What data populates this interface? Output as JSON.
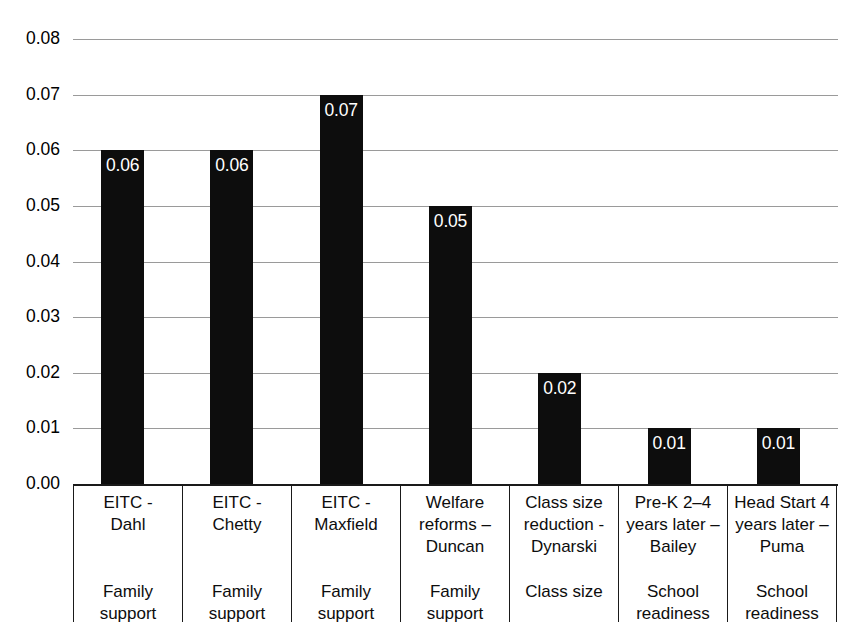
{
  "chart_data": {
    "type": "bar",
    "title": "",
    "subtitle": "",
    "xlabel": "",
    "ylabel": "",
    "ylim": [
      0.0,
      0.08
    ],
    "ytick_labels": [
      "0.08",
      "0.07",
      "0.06",
      "0.05",
      "0.04",
      "0.03",
      "0.02",
      "0.01",
      "0.00"
    ],
    "ytick_values": [
      0.08,
      0.07,
      0.06,
      0.05,
      0.04,
      0.03,
      0.02,
      0.01,
      0.0
    ],
    "grid": true,
    "grid_axis": "y",
    "legend": "none",
    "bar_color": "#0d0d0d",
    "data_label_color": "#ffffff",
    "gridline_color": "#9a9a9a",
    "categories": [
      "EITC - Dahl",
      "EITC - Chetty",
      "EITC - Maxfield",
      "Welfare reforms – Duncan",
      "Class size reduction - Dynarski",
      "Pre-K 2–4 years later – Bailey",
      "Head Start 4 years later – Puma"
    ],
    "values": [
      0.06,
      0.06,
      0.07,
      0.05,
      0.02,
      0.01,
      0.01
    ],
    "data_labels": [
      "0.06",
      "0.06",
      "0.07",
      "0.05",
      "0.02",
      "0.01",
      "0.01"
    ],
    "groups": [
      "Family support",
      "Family support",
      "Family support",
      "Family support",
      "Class size",
      "School readiness",
      "School readiness"
    ]
  },
  "axis": {
    "y_ticks": [
      {
        "label": "0.08",
        "value": 0.08
      },
      {
        "label": "0.07",
        "value": 0.07
      },
      {
        "label": "0.06",
        "value": 0.06
      },
      {
        "label": "0.05",
        "value": 0.05
      },
      {
        "label": "0.04",
        "value": 0.04
      },
      {
        "label": "0.03",
        "value": 0.03
      },
      {
        "label": "0.02",
        "value": 0.02
      },
      {
        "label": "0.01",
        "value": 0.01
      },
      {
        "label": "0.00",
        "value": 0.0
      }
    ]
  },
  "categories_table": {
    "rows": [
      {
        "name_lines": [
          "EITC -",
          "Dahl"
        ],
        "group_lines": [
          "Family",
          "support"
        ]
      },
      {
        "name_lines": [
          "EITC -",
          "Chetty"
        ],
        "group_lines": [
          "Family",
          "support"
        ]
      },
      {
        "name_lines": [
          "EITC -",
          "Maxfield"
        ],
        "group_lines": [
          "Family",
          "support"
        ]
      },
      {
        "name_lines": [
          "Welfare",
          "reforms –",
          "Duncan"
        ],
        "group_lines": [
          "Family",
          "support"
        ]
      },
      {
        "name_lines": [
          "Class size",
          "reduction -",
          "Dynarski"
        ],
        "group_lines": [
          "Class size"
        ]
      },
      {
        "name_lines": [
          "Pre-K 2–4",
          "years later –",
          "Bailey"
        ],
        "group_lines": [
          "School",
          "readiness"
        ]
      },
      {
        "name_lines": [
          "Head Start 4",
          "years later –",
          "Puma"
        ],
        "group_lines": [
          "School",
          "readiness"
        ]
      }
    ]
  },
  "bars": [
    {
      "label": "0.06",
      "value": 0.06
    },
    {
      "label": "0.06",
      "value": 0.06
    },
    {
      "label": "0.07",
      "value": 0.07
    },
    {
      "label": "0.05",
      "value": 0.05
    },
    {
      "label": "0.02",
      "value": 0.02
    },
    {
      "label": "0.01",
      "value": 0.01
    },
    {
      "label": "0.01",
      "value": 0.01
    }
  ]
}
